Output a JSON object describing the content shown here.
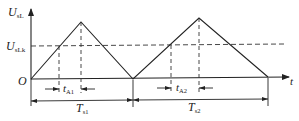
{
  "diagram": {
    "type": "waveform",
    "y_axis": {
      "symbol": "U",
      "subscript": "sL"
    },
    "x_axis": {
      "symbol": "t"
    },
    "origin": "O",
    "threshold": {
      "symbol": "U",
      "subscript": "sLk"
    },
    "intervals": [
      {
        "symbol": "t",
        "subscript": "A1"
      },
      {
        "symbol": "t",
        "subscript": "A2"
      }
    ],
    "periods": [
      {
        "symbol": "T",
        "subscript": "s1"
      },
      {
        "symbol": "T",
        "subscript": "s2"
      }
    ],
    "colors": {
      "line": "#222222",
      "background": "#ffffff"
    }
  }
}
